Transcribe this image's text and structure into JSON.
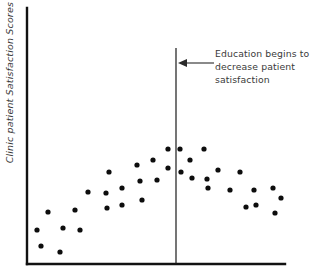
{
  "chart_data": {
    "type": "scatter",
    "title": "",
    "xlabel": "",
    "ylabel": "Clinic patient Satisfaction Scores",
    "xlim": [
      0,
      100
    ],
    "ylim": [
      0,
      100
    ],
    "grid": false,
    "legend": null,
    "point_color": "#0d0d0d",
    "axis_color": "#111111",
    "x": [
      4,
      5,
      8,
      13,
      14,
      19,
      21,
      24,
      32,
      31,
      36,
      37,
      43,
      46,
      43,
      49,
      55,
      59,
      45,
      55,
      60,
      61,
      56,
      60,
      66,
      72,
      79,
      82,
      86,
      96,
      98,
      69,
      78,
      89,
      95,
      99
    ],
    "y": [
      31,
      19,
      42,
      15,
      32,
      45,
      32,
      53,
      48,
      37,
      56,
      40,
      62,
      56,
      28,
      50,
      65,
      64,
      25,
      40,
      59,
      55,
      65,
      50,
      44,
      50,
      43,
      49,
      47,
      45,
      39,
      55,
      37,
      33,
      36,
      31
    ],
    "points": [
      {
        "cx": 37,
        "cy": 230
      },
      {
        "cx": 41,
        "cy": 246
      },
      {
        "cx": 48,
        "cy": 212
      },
      {
        "cx": 60,
        "cy": 252
      },
      {
        "cx": 63,
        "cy": 228
      },
      {
        "cx": 75,
        "cy": 210
      },
      {
        "cx": 80,
        "cy": 230
      },
      {
        "cx": 88,
        "cy": 192
      },
      {
        "cx": 106,
        "cy": 193
      },
      {
        "cx": 107,
        "cy": 208
      },
      {
        "cx": 109,
        "cy": 172
      },
      {
        "cx": 122,
        "cy": 188
      },
      {
        "cx": 122,
        "cy": 205
      },
      {
        "cx": 137,
        "cy": 165
      },
      {
        "cx": 140,
        "cy": 181
      },
      {
        "cx": 142,
        "cy": 200
      },
      {
        "cx": 153,
        "cy": 160
      },
      {
        "cx": 157,
        "cy": 180
      },
      {
        "cx": 168,
        "cy": 149
      },
      {
        "cx": 168,
        "cy": 168
      },
      {
        "cx": 180,
        "cy": 149
      },
      {
        "cx": 181,
        "cy": 172
      },
      {
        "cx": 190,
        "cy": 160
      },
      {
        "cx": 192,
        "cy": 178
      },
      {
        "cx": 204,
        "cy": 149
      },
      {
        "cx": 207,
        "cy": 179
      },
      {
        "cx": 208,
        "cy": 188
      },
      {
        "cx": 218,
        "cy": 170
      },
      {
        "cx": 230,
        "cy": 190
      },
      {
        "cx": 240,
        "cy": 172
      },
      {
        "cx": 246,
        "cy": 207
      },
      {
        "cx": 254,
        "cy": 190
      },
      {
        "cx": 256,
        "cy": 205
      },
      {
        "cx": 273,
        "cy": 188
      },
      {
        "cx": 275,
        "cy": 213
      },
      {
        "cx": 281,
        "cy": 198
      }
    ],
    "point_radius": 2.6,
    "reference_line": {
      "label": "education-threshold",
      "x_pixel": 176,
      "y_top_pixel": 48,
      "y_bottom_pixel": 264,
      "color": "#1a1a1a"
    },
    "annotations": [
      {
        "text": "Education begins to decrease patient satisfaction",
        "line1": "Education begins to",
        "line2": "decrease patient",
        "line3": "satisfaction",
        "arrow_from_x": 214,
        "arrow_to_x": 178,
        "arrow_y": 63,
        "color": "#3a3a3a"
      }
    ],
    "axes": {
      "y_axis_x": 27,
      "y_axis_top": 8,
      "y_axis_bottom": 264,
      "x_axis_y": 264,
      "x_axis_left": 27,
      "x_axis_right": 285
    }
  },
  "figure": {
    "y_axis_label": "Clinic patient Satisfaction Scores",
    "annotation": "Education begins to decrease patient satisfaction"
  }
}
